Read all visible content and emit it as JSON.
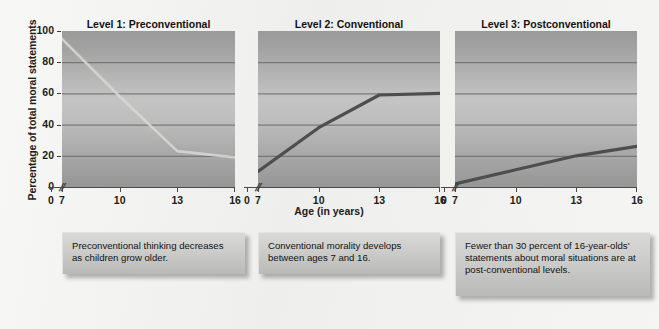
{
  "figure": {
    "y_axis_title": "Percentage of total moral statements",
    "x_axis_title": "Age (in years)",
    "y_ticks": [
      "100",
      "80",
      "60",
      "40",
      "20",
      "0"
    ],
    "x_ticks": [
      "0",
      "7",
      "10",
      "13",
      "16"
    ],
    "axis_break_glyph": "//",
    "colors": {
      "page_background": "#eeeeec",
      "plot_top": "#9a9a9a",
      "plot_mid": "#c4c4c4",
      "plot_bottom": "#969696",
      "gridline": "#6e6e6e",
      "line_light": "#d8d8d4",
      "line_dark": "#4e4e4e",
      "caption_fill": "#cfcfcd",
      "text": "#131313"
    }
  },
  "panels": [
    {
      "title": "Level 1: Preconventional",
      "caption": "Preconventional thinking decreases as children grow older.",
      "line_style": "light"
    },
    {
      "title": "Level 2: Conventional",
      "caption": "Conventional morality develops between ages 7 and 16.",
      "line_style": "dark"
    },
    {
      "title": "Level 3: Postconventional",
      "caption": "Fewer than 30 percent of 16-year-olds' statements about moral situations are at post-conventional levels.",
      "line_style": "dark"
    }
  ],
  "chart_data": [
    {
      "type": "line",
      "title": "Level 1: Preconventional",
      "xlabel": "Age (in years)",
      "ylabel": "Percentage of total moral statements",
      "x": [
        7,
        10,
        13,
        16
      ],
      "values": [
        95,
        58,
        23,
        19
      ],
      "series": [
        {
          "name": "Level 1: Preconventional",
          "points": [
            {
              "age": 7,
              "percentage": 95
            },
            {
              "age": 10,
              "percentage": 58
            },
            {
              "age": 13,
              "percentage": 23
            },
            {
              "age": 16,
              "percentage": 19
            }
          ]
        }
      ],
      "xlim": [
        7,
        16
      ],
      "ylim": [
        0,
        100
      ],
      "xticks": [
        0,
        7,
        10,
        13,
        16
      ],
      "yticks": [
        0,
        20,
        40,
        60,
        80,
        100
      ],
      "grid": "horizontal",
      "legend": "none",
      "axis_break_between": [
        0,
        7
      ],
      "annotation": "Preconventional thinking decreases as children grow older."
    },
    {
      "type": "line",
      "title": "Level 2: Conventional",
      "xlabel": "Age (in years)",
      "ylabel": "Percentage of total moral statements",
      "x": [
        7,
        10,
        13,
        16
      ],
      "values": [
        10,
        38,
        59,
        60
      ],
      "series": [
        {
          "name": "Level 2: Conventional",
          "points": [
            {
              "age": 7,
              "percentage": 10
            },
            {
              "age": 10,
              "percentage": 38
            },
            {
              "age": 13,
              "percentage": 59
            },
            {
              "age": 16,
              "percentage": 60
            }
          ]
        }
      ],
      "xlim": [
        7,
        16
      ],
      "ylim": [
        0,
        100
      ],
      "xticks": [
        0,
        7,
        10,
        13,
        16
      ],
      "yticks": [
        0,
        20,
        40,
        60,
        80,
        100
      ],
      "grid": "horizontal",
      "legend": "none",
      "axis_break_between": [
        0,
        7
      ],
      "annotation": "Conventional morality develops between ages 7 and 16."
    },
    {
      "type": "line",
      "title": "Level 3: Postconventional",
      "xlabel": "Age (in years)",
      "ylabel": "Percentage of total moral statements",
      "x": [
        7,
        10,
        13,
        16
      ],
      "values": [
        2,
        11,
        20,
        26
      ],
      "series": [
        {
          "name": "Level 3: Postconventional",
          "points": [
            {
              "age": 7,
              "percentage": 2
            },
            {
              "age": 10,
              "percentage": 11
            },
            {
              "age": 13,
              "percentage": 20
            },
            {
              "age": 16,
              "percentage": 26
            }
          ]
        }
      ],
      "xlim": [
        7,
        16
      ],
      "ylim": [
        0,
        100
      ],
      "xticks": [
        0,
        7,
        10,
        13,
        16
      ],
      "yticks": [
        0,
        20,
        40,
        60,
        80,
        100
      ],
      "grid": "horizontal",
      "legend": "none",
      "axis_break_between": [
        0,
        7
      ],
      "annotation": "Fewer than 30 percent of 16-year-olds' statements about moral situations are at post-conventional levels."
    }
  ]
}
